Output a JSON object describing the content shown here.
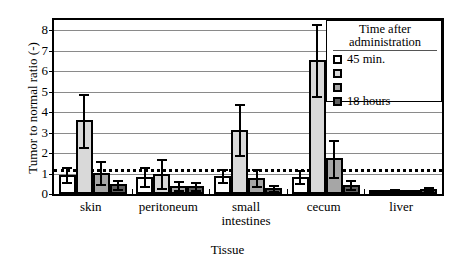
{
  "chart_data": {
    "type": "bar",
    "title": "",
    "xlabel": "Tissue",
    "ylabel": "Tumor to normal ratio (-)",
    "categories": [
      "skin",
      "peritoneum",
      "small intestines",
      "cecum",
      "liver"
    ],
    "ylim": [
      0,
      8.5
    ],
    "yticks": [
      0,
      1,
      2,
      3,
      4,
      5,
      6,
      7,
      8
    ],
    "grid": true,
    "legend_position": "top-right",
    "legend_title": "Time after administration",
    "reference_line": {
      "value": 1.2,
      "style": "dotted",
      "color": "#000000"
    },
    "series": [
      {
        "name": "45 min.",
        "color": "#ffffff",
        "values": [
          0.95,
          0.85,
          0.9,
          0.85,
          0.12
        ],
        "errors": [
          0.35,
          0.45,
          0.3,
          0.3,
          0.05
        ]
      },
      {
        "name": "",
        "color": "#d9d9d9",
        "values": [
          3.6,
          1.0,
          3.15,
          6.55,
          0.18
        ],
        "errors": [
          1.3,
          0.7,
          1.25,
          1.75,
          0.06
        ]
      },
      {
        "name": "",
        "color": "#a6a6a6",
        "values": [
          1.05,
          0.4,
          0.8,
          1.75,
          0.15
        ],
        "errors": [
          0.55,
          0.22,
          0.4,
          0.9,
          0.05
        ]
      },
      {
        "name": "18 hours",
        "color": "#5f5f5f",
        "values": [
          0.48,
          0.4,
          0.3,
          0.45,
          0.25
        ],
        "errors": [
          0.22,
          0.2,
          0.13,
          0.22,
          0.07
        ]
      }
    ]
  },
  "legend": {
    "title_line1": "Time after",
    "title_line2": "administration",
    "items": [
      {
        "label": "45 min.",
        "color": "#ffffff"
      },
      {
        "label": "",
        "color": "#d9d9d9"
      },
      {
        "label": "",
        "color": "#a6a6a6"
      },
      {
        "label": "18 hours",
        "color": "#5f5f5f"
      }
    ]
  },
  "axes": {
    "y_title": "Tumor to normal ratio (-)",
    "x_title": "Tissue",
    "y_tick_labels": [
      "0",
      "1",
      "2",
      "3",
      "4",
      "5",
      "6",
      "7",
      "8"
    ],
    "x_tick_labels": [
      "skin",
      "peritoneum",
      "small intestines",
      "cecum",
      "liver"
    ]
  }
}
